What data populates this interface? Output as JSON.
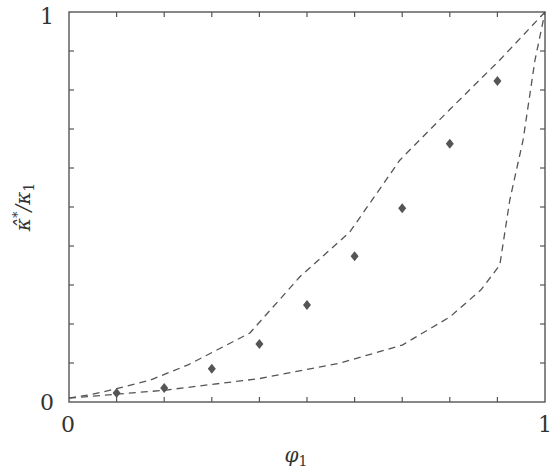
{
  "chart_data": {
    "type": "scatter",
    "title": "",
    "xlabel": "φ₁",
    "ylabel": "κ̂* / κ₁",
    "xlim": [
      0,
      1
    ],
    "ylim": [
      0,
      1
    ],
    "x_tick_labels": [
      "0",
      "1"
    ],
    "y_tick_labels": [
      "0",
      "1"
    ],
    "minor_tick_step": 0.1,
    "grid": false,
    "legend": null,
    "series": [
      {
        "name": "data",
        "type": "scatter",
        "marker": "diamond",
        "color": "#555555",
        "x": [
          0.1,
          0.2,
          0.3,
          0.4,
          0.5,
          0.6,
          0.7,
          0.8,
          0.9
        ],
        "y": [
          0.023,
          0.036,
          0.085,
          0.149,
          0.249,
          0.374,
          0.497,
          0.662,
          0.823
        ]
      },
      {
        "name": "upper bound",
        "type": "line",
        "style": "dashed",
        "color": "#555555",
        "x": [
          0.0,
          0.05,
          0.1,
          0.17,
          0.25,
          0.38,
          0.485,
          0.59,
          0.695,
          0.8,
          0.905,
          1.0
        ],
        "y": [
          0.01,
          0.02,
          0.034,
          0.056,
          0.095,
          0.177,
          0.321,
          0.436,
          0.62,
          0.75,
          0.877,
          1.0
        ]
      },
      {
        "name": "lower bound",
        "type": "line",
        "style": "dashed",
        "color": "#555555",
        "x": [
          0.0,
          0.1,
          0.2,
          0.3,
          0.4,
          0.57,
          0.7,
          0.8,
          0.865,
          0.905,
          0.926,
          0.954,
          0.979,
          1.0
        ],
        "y": [
          0.01,
          0.02,
          0.03,
          0.045,
          0.06,
          0.1,
          0.146,
          0.218,
          0.287,
          0.351,
          0.518,
          0.672,
          0.877,
          1.0
        ]
      }
    ]
  },
  "labels": {
    "x_axis": "φ",
    "x_axis_sub": "1",
    "y_axis_main": "κ̂",
    "y_axis_sup": "*",
    "y_axis_rest": "/κ",
    "y_axis_sub": "1",
    "x_min": "0",
    "x_max": "1",
    "y_min": "0",
    "y_max": "1"
  }
}
